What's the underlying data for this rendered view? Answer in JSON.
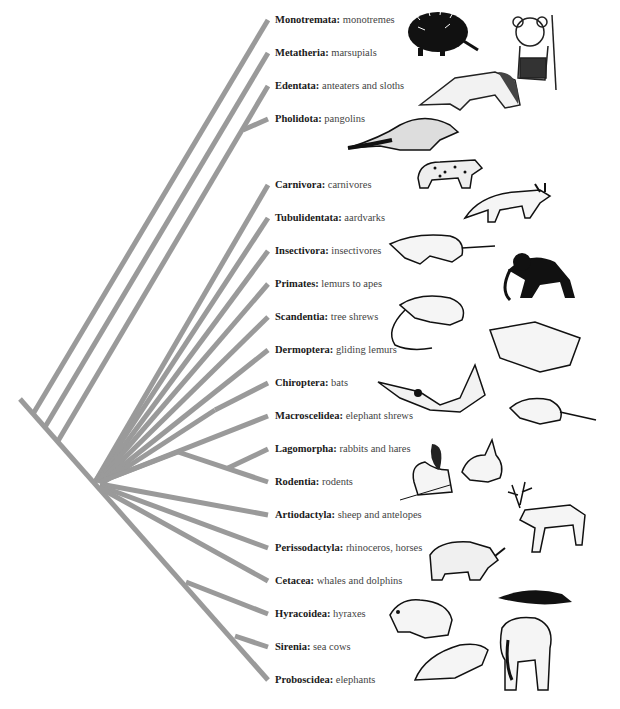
{
  "diagram": {
    "type": "phylogenetic-tree",
    "branch_color": "#9a9a9a",
    "taxa": [
      {
        "order": "Monotremata:",
        "common": " monotremes",
        "y": 20
      },
      {
        "order": "Metatheria:",
        "common": " marsupials",
        "y": 53
      },
      {
        "order": "Edentata:",
        "common": " anteaters and sloths",
        "y": 86
      },
      {
        "order": "Pholidota:",
        "common": " pangolins",
        "y": 119
      },
      {
        "order": "Carnivora:",
        "common": " carnivores",
        "y": 185
      },
      {
        "order": "Tubulidentata:",
        "common": "  aardvarks",
        "y": 218
      },
      {
        "order": "Insectivora:",
        "common": " insectivores",
        "y": 251
      },
      {
        "order": "Primates:",
        "common": " lemurs to apes",
        "y": 284
      },
      {
        "order": "Scandentia:",
        "common": " tree shrews",
        "y": 317
      },
      {
        "order": "Dermoptera:",
        "common": " gliding lemurs",
        "y": 350
      },
      {
        "order": "Chiroptera:",
        "common": " bats",
        "y": 383
      },
      {
        "order": "Macroscelidea:",
        "common": "  elephant shrews",
        "y": 416
      },
      {
        "order": "Lagomorpha:",
        "common": " rabbits and hares",
        "y": 449
      },
      {
        "order": "Rodentia:",
        "common": " rodents",
        "y": 482
      },
      {
        "order": "Artiodactyla:",
        "common": " sheep and antelopes",
        "y": 515
      },
      {
        "order": "Perissodactyla:",
        "common": " rhinoceros, horses",
        "y": 548
      },
      {
        "order": "Cetacea:",
        "common": " whales and dolphins",
        "y": 581
      },
      {
        "order": "Hyracoidea:",
        "common": " hyraxes",
        "y": 614
      },
      {
        "order": "Sirenia:",
        "common": " sea cows",
        "y": 647
      },
      {
        "order": "Proboscidea:",
        "common": " elephants",
        "y": 680
      }
    ],
    "illustrations": [
      "echidna",
      "koala",
      "anteater",
      "pangolin",
      "leopard",
      "aardvark",
      "shrew",
      "monkey",
      "tree-shrew",
      "colugo",
      "bat",
      "elephant-shrew",
      "squirrel",
      "rabbit",
      "reindeer",
      "rhinoceros",
      "dolphin",
      "hyrax",
      "manatee",
      "elephant"
    ]
  }
}
